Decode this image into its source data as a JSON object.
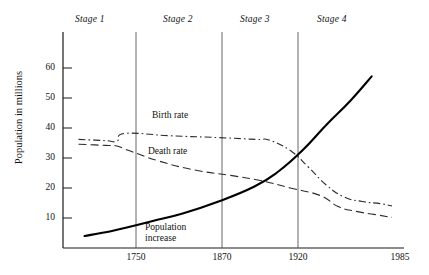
{
  "chart_data": {
    "type": "line",
    "title": "",
    "xlabel": "",
    "ylabel": "Population in millions",
    "xlim": [
      1700,
      1985
    ],
    "ylim": [
      0,
      66
    ],
    "grid": false,
    "legend_position": "inline-annotations",
    "y_ticks": [
      10,
      20,
      30,
      40,
      50,
      60
    ],
    "x_ticks": [
      1750,
      1870,
      1920,
      1985
    ],
    "stage_dividers": [
      1750,
      1870,
      1920
    ],
    "stages": [
      {
        "name": "Stage 1",
        "range": [
          1700,
          1750
        ]
      },
      {
        "name": "Stage 2",
        "range": [
          1750,
          1870
        ]
      },
      {
        "name": "Stage 3",
        "range": [
          1870,
          1920
        ]
      },
      {
        "name": "Stage 4",
        "range": [
          1920,
          1985
        ]
      }
    ],
    "series": [
      {
        "name": "Birth rate",
        "style": "dash-dot",
        "x": [
          1713,
          1735,
          1745,
          1752,
          1790,
          1830,
          1862,
          1872,
          1890,
          1905,
          1920,
          1935,
          1950,
          1965,
          1975
        ],
        "values": [
          36.2,
          35.8,
          35.6,
          38.2,
          37.4,
          36.8,
          36.2,
          36.0,
          32.5,
          27.0,
          21.0,
          17.0,
          15.5,
          14.8,
          14.0
        ]
      },
      {
        "name": "Death rate",
        "style": "long-dash",
        "x": [
          1713,
          1735,
          1745,
          1755,
          1780,
          1810,
          1840,
          1865,
          1890,
          1915,
          1930,
          1945,
          1960,
          1975
        ],
        "values": [
          34.6,
          34.2,
          34.0,
          32.5,
          29.0,
          26.0,
          24.2,
          22.5,
          20.0,
          17.5,
          13.8,
          12.2,
          11.2,
          10.2
        ]
      },
      {
        "name": "Population increase",
        "style": "solid-bold",
        "x": [
          1718,
          1740,
          1755,
          1775,
          1800,
          1830,
          1860,
          1880,
          1900,
          1920,
          1940,
          1958
        ],
        "values": [
          4.0,
          5.6,
          7.0,
          9.0,
          11.5,
          15.5,
          20.5,
          25.5,
          32.5,
          41.0,
          49.0,
          57.2
        ]
      }
    ],
    "annotations": [
      {
        "text": "Birth rate",
        "at_x": 1800,
        "at_y": 40.5
      },
      {
        "text": "Death rate",
        "at_x": 1795,
        "at_y": 30.5
      },
      {
        "text": "Population increase",
        "at_x": 1785,
        "at_y": 6.0
      }
    ]
  },
  "axis": {
    "y_title": "Population in millions",
    "y_tick_labels": [
      "60",
      "50",
      "40",
      "30",
      "20",
      "10"
    ],
    "x_tick_labels": [
      "1750",
      "1870",
      "1920",
      "1985"
    ]
  },
  "stage_labels": [
    "Stage 1",
    "Stage 2",
    "Stage 3",
    "Stage 4"
  ],
  "series_labels": {
    "birth": "Birth rate",
    "death": "Death rate",
    "population_line1": "Population",
    "population_line2": "increase"
  },
  "colors": {
    "axis": "#1a1a1a",
    "divider": "#555555",
    "birth_rate": "#2b2b2b",
    "death_rate": "#2b2b2b",
    "population": "#000000",
    "background": "#ffffff"
  }
}
